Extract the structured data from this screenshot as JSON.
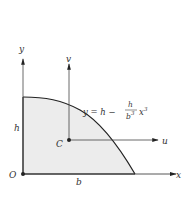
{
  "diagram": {
    "type": "area-under-cubic-curve",
    "colors": {
      "fill": "#ececec",
      "stroke": "#222222",
      "axis": "#444444",
      "text": "#333333"
    },
    "axes": {
      "x_label": "x",
      "y_label": "y",
      "u_label": "u",
      "v_label": "v"
    },
    "points": {
      "origin_label": "O",
      "centroid_label": "C"
    },
    "dimensions": {
      "height_label": "h",
      "base_label": "b"
    },
    "equation": {
      "lhs": "y = h −",
      "frac_num": "h",
      "frac_den": "b",
      "frac_den_exp": "3",
      "var": "x",
      "var_exp": "3"
    }
  }
}
